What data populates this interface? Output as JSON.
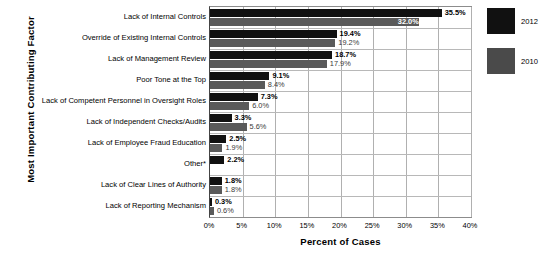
{
  "chart_data": {
    "type": "bar",
    "orientation": "horizontal",
    "title": "",
    "xlabel": "Percent of Cases",
    "ylabel": "Most Important Contributing Factor",
    "xlim": [
      0,
      40
    ],
    "xticks": [
      "0%",
      "5%",
      "10%",
      "15%",
      "20%",
      "25%",
      "30%",
      "35%",
      "40%"
    ],
    "xtick_values": [
      0,
      5,
      10,
      15,
      20,
      25,
      30,
      35,
      40
    ],
    "grid": true,
    "legend_position": "right",
    "categories": [
      "Lack of Internal Controls",
      "Override of Existing Internal Controls",
      "Lack of Management Review",
      "Poor Tone at the Top",
      "Lack of Competent Personnel in Oversight Roles",
      "Lack of Independent Checks/Audits",
      "Lack of Employee Fraud Education",
      "Other*",
      "Lack of Clear Lines of Authority",
      "Lack of Reporting Mechanism"
    ],
    "series": [
      {
        "name": "2012",
        "color": "#111111",
        "values": [
          35.5,
          19.4,
          18.7,
          9.1,
          7.3,
          3.3,
          2.5,
          2.2,
          1.8,
          0.3
        ],
        "labels": [
          "35.5%",
          "19.4%",
          "18.7%",
          "9.1%",
          "7.3%",
          "3.3%",
          "2.5%",
          "2.2%",
          "1.8%",
          "0.3%"
        ]
      },
      {
        "name": "2010",
        "color": "#5a5a5a",
        "values": [
          32.0,
          19.2,
          17.9,
          8.4,
          6.0,
          5.6,
          1.9,
          null,
          1.8,
          0.6
        ],
        "labels": [
          "32.0%",
          "19.2%",
          "17.9%",
          "8.4%",
          "6.0%",
          "5.6%",
          "1.9%",
          "",
          "1.8%",
          "0.6%"
        ]
      }
    ]
  },
  "legend": {
    "items": [
      {
        "label": "2012",
        "color": "#111111"
      },
      {
        "label": "2010",
        "color": "#4a4a4a"
      }
    ]
  }
}
